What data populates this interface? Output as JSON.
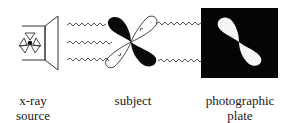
{
  "labels": {
    "source": [
      "x-ray",
      "source"
    ],
    "subject": [
      "subject"
    ],
    "plate": [
      "photographic",
      "plate"
    ]
  },
  "colors": {
    "ink": "#111111",
    "background": "#ffffff",
    "plate": "#050505"
  }
}
